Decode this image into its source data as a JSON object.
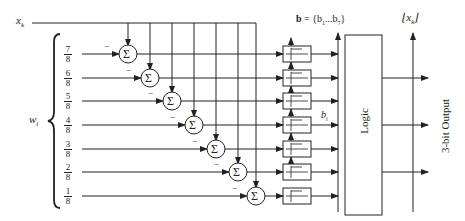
{
  "diagram": {
    "input_label": "x",
    "input_subscript": "k",
    "weights_label": "w",
    "weights_subscript": "i",
    "weights": [
      {
        "num": "7",
        "den": "8"
      },
      {
        "num": "6",
        "den": "8"
      },
      {
        "num": "5",
        "den": "8"
      },
      {
        "num": "4",
        "den": "8"
      },
      {
        "num": "3",
        "den": "8"
      },
      {
        "num": "2",
        "den": "8"
      },
      {
        "num": "1",
        "den": "8"
      }
    ],
    "summer_symbol": "Σ",
    "minus_sign": "−",
    "bus_label_bold": "b",
    "bus_label_rest": " = {b",
    "bus_label_sub1": "1",
    "bus_label_mid": "...b",
    "bus_label_sub7": "7",
    "bus_label_close": "}",
    "bit_label": "b",
    "bit_subscript": "i",
    "logic_label": "Logic",
    "floor_output_label": "x",
    "floor_output_subscript": "k",
    "output_label": "3-bit Output",
    "colors": {
      "stroke": "#222222",
      "background": "#ffffff"
    }
  }
}
